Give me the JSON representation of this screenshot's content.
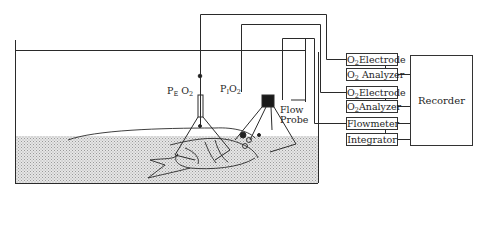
{
  "diagram": {
    "type": "experimental-apparatus",
    "labels": {
      "pe_o2": {
        "main": "P",
        "sub1": "E",
        "mid": " O",
        "sub2": "2"
      },
      "pi_o2": {
        "main": "P",
        "sub1": "I",
        "mid": "O",
        "sub2": "2"
      },
      "flow_probe_line1": "Flow",
      "flow_probe_line2": "Probe"
    },
    "instruments": [
      {
        "id": "o2-electrode-1",
        "prefix": "O",
        "sub": "2",
        "label": "Electrode"
      },
      {
        "id": "o2-analyzer-1",
        "prefix": "O",
        "sub": "2",
        "label": " Analyzer"
      },
      {
        "id": "o2-electrode-2",
        "prefix": "O",
        "sub": "2",
        "label": "Electrode"
      },
      {
        "id": "o2-analyzer-2",
        "prefix": "O",
        "sub": "2",
        "label": "Analyzer"
      },
      {
        "id": "flowmeter",
        "label": "Flowmeter"
      },
      {
        "id": "integrator",
        "label": "Integrator"
      }
    ],
    "recorder": {
      "label": "Recorder"
    },
    "colors": {
      "line": "#2a2a2a",
      "water_stipple": "#bdbdbd",
      "background": "#ffffff"
    }
  }
}
